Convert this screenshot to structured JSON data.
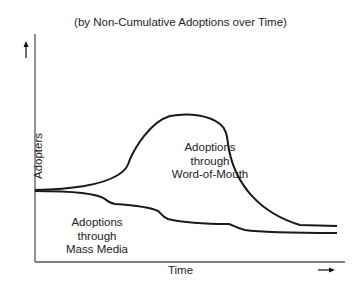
{
  "title": "(by Non-Cumulative Adoptions over Time)",
  "axes": {
    "xlabel": "Time",
    "ylabel": "Adopters",
    "x_arrow": "right-arrow",
    "y_arrow": "up-arrow"
  },
  "regions": {
    "word_of_mouth": [
      "Adoptions",
      "through",
      "Word-of-Mouth"
    ],
    "mass_media": [
      "Adoptions",
      "through",
      "Mass Media"
    ]
  },
  "colors": {
    "line": "#1a1a1a",
    "axis": "#555555",
    "background": "#ffffff"
  }
}
